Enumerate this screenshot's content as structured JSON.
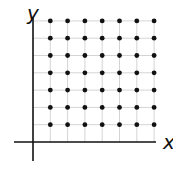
{
  "diagram": {
    "x_axis_label": "x",
    "y_axis_label": "y",
    "lattice": {
      "columns": 7,
      "rows": 7
    },
    "colors": {
      "axis": "#111111",
      "grid": "#d4d4d4",
      "point": "#111111",
      "background": "#ffffff"
    }
  },
  "chart_data": {
    "type": "scatter",
    "title": "",
    "xlabel": "x",
    "ylabel": "y",
    "grid": true,
    "points": [
      [
        1,
        1
      ],
      [
        2,
        1
      ],
      [
        3,
        1
      ],
      [
        4,
        1
      ],
      [
        5,
        1
      ],
      [
        6,
        1
      ],
      [
        7,
        1
      ],
      [
        1,
        2
      ],
      [
        2,
        2
      ],
      [
        3,
        2
      ],
      [
        4,
        2
      ],
      [
        5,
        2
      ],
      [
        6,
        2
      ],
      [
        7,
        2
      ],
      [
        1,
        3
      ],
      [
        2,
        3
      ],
      [
        3,
        3
      ],
      [
        4,
        3
      ],
      [
        5,
        3
      ],
      [
        6,
        3
      ],
      [
        7,
        3
      ],
      [
        1,
        4
      ],
      [
        2,
        4
      ],
      [
        3,
        4
      ],
      [
        4,
        4
      ],
      [
        5,
        4
      ],
      [
        6,
        4
      ],
      [
        7,
        4
      ],
      [
        1,
        5
      ],
      [
        2,
        5
      ],
      [
        3,
        5
      ],
      [
        4,
        5
      ],
      [
        5,
        5
      ],
      [
        6,
        5
      ],
      [
        7,
        5
      ],
      [
        1,
        6
      ],
      [
        2,
        6
      ],
      [
        3,
        6
      ],
      [
        4,
        6
      ],
      [
        5,
        6
      ],
      [
        6,
        6
      ],
      [
        7,
        6
      ],
      [
        1,
        7
      ],
      [
        2,
        7
      ],
      [
        3,
        7
      ],
      [
        4,
        7
      ],
      [
        5,
        7
      ],
      [
        6,
        7
      ],
      [
        7,
        7
      ]
    ],
    "xlim": [
      0,
      7
    ],
    "ylim": [
      0,
      7
    ]
  }
}
